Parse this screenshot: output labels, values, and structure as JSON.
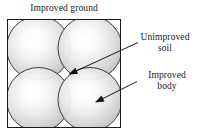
{
  "figure": {
    "title": "Improved ground",
    "background_color": "#ffffff",
    "frame": {
      "name": "improved-ground-boundary",
      "x": 7.5,
      "y": 19.5,
      "width": 113,
      "height": 108,
      "stroke": "#1a1a1a",
      "fill": "#ffffff"
    }
  },
  "chart_data": {
    "type": "diagram",
    "title": "Improved ground",
    "units": "none",
    "circles": [
      {
        "id": "improved-body-top-left",
        "cx": 38.5,
        "cy": 48.0,
        "r": 32.0
      },
      {
        "id": "improved-body-top-right",
        "cx": 90.0,
        "cy": 48.0,
        "r": 32.0
      },
      {
        "id": "improved-body-bottom-left",
        "cx": 38.5,
        "cy": 99.5,
        "r": 32.0
      },
      {
        "id": "improved-body-bottom-right",
        "cx": 90.0,
        "cy": 99.5,
        "r": 32.0
      }
    ],
    "circle_style": {
      "stroke": "#2b2b2b",
      "gradient_center": "#fdfdfd",
      "gradient_mid": "#e2e2e2",
      "gradient_edge": "#bdbdbd"
    },
    "annotations": [
      {
        "id": "unimproved-soil",
        "label_lines": [
          "Unimproved",
          "soil"
        ],
        "label_x": 165,
        "label_y": 42,
        "arrow_from": [
          138,
          42.5
        ],
        "arrow_to": [
          68.5,
          74.5
        ]
      },
      {
        "id": "improved-body",
        "label_lines": [
          "Improved",
          "body"
        ],
        "label_x": 167,
        "label_y": 80,
        "arrow_from": [
          137,
          81.5
        ],
        "arrow_to": [
          95.0,
          102.5
        ]
      }
    ]
  },
  "labels": {
    "unimproved_soil_line1": "Unimproved",
    "unimproved_soil_line2": "soil",
    "improved_body_line1": "Improved",
    "improved_body_line2": "body"
  }
}
